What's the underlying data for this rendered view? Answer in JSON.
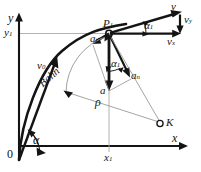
{
  "figure": {
    "kind": "projectile-trajectory-kinematics-diagram",
    "background_color": "#ffffff",
    "stroke_color": "#141414",
    "thin_stroke_color": "#9a9a9a",
    "axes": {
      "x_label": "x",
      "y_label": "y",
      "origin_label": "0",
      "x1_label": "x",
      "x1_sub": "1",
      "y1_label": "y",
      "y1_sub": "1"
    },
    "curve_label": "Bahn",
    "point_labels": {
      "p1": "P",
      "p1_sub": "1",
      "k": "K"
    },
    "vectors": {
      "v0": "v",
      "v0_sub": "0",
      "v": "v",
      "vx": "v",
      "vx_sub": "x",
      "vy": "v",
      "vy_sub": "y",
      "a": "a",
      "an": "a",
      "an_sub": "n",
      "at": "a",
      "at_sub": "t"
    },
    "angles": {
      "alpha": "α",
      "alpha1_top": "α",
      "alpha1_top_sub": "1",
      "alpha1_mid": "α",
      "alpha1_mid_sub": "1"
    },
    "radius_label": "ρ"
  }
}
